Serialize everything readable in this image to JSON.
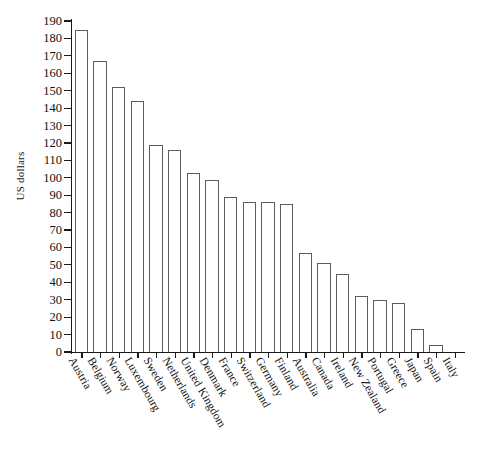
{
  "chart_data": {
    "type": "bar",
    "title": "",
    "subtitle": "",
    "xlabel": "",
    "ylabel": "US dollars",
    "ylim": [
      0,
      190
    ],
    "ytick_step": 10,
    "grid": false,
    "legend": false,
    "orientation": "vertical",
    "bar_style": {
      "fill": "#ffffff",
      "edge": "#5d5d5d"
    },
    "xtick_labels_rotation_deg": 60,
    "categories": [
      "Austria",
      "Belgium",
      "Norway",
      "Luxembourg",
      "Sweden",
      "Netherlands",
      "United Kingdom",
      "Denmark",
      "France",
      "Switzerland",
      "Germany",
      "Finland",
      "Australia",
      "Canada",
      "Ireland",
      "New Zealand",
      "Portugal",
      "Greece",
      "Japan",
      "Spain",
      "Italy"
    ],
    "values": [
      185,
      167,
      152,
      144,
      119,
      116,
      103,
      99,
      89,
      86,
      86,
      85,
      57,
      51,
      45,
      32,
      30,
      28,
      13,
      4,
      0
    ],
    "yticks": [
      "0",
      "10",
      "20",
      "30",
      "40",
      "50",
      "60",
      "70",
      "80",
      "90",
      "100",
      "110",
      "120",
      "130",
      "140",
      "150",
      "160",
      "170",
      "180",
      "190"
    ],
    "ytick_values": [
      0,
      10,
      20,
      30,
      40,
      50,
      60,
      70,
      80,
      90,
      100,
      110,
      120,
      130,
      140,
      150,
      160,
      170,
      180,
      190
    ]
  }
}
